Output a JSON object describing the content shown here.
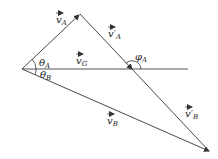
{
  "diagram": {
    "colors": {
      "line": "#333333",
      "background": "#ffffff"
    },
    "points": {
      "origin": [
        22,
        69
      ],
      "apex": [
        80,
        14
      ],
      "line_end": [
        188,
        69
      ],
      "bottom_tip": [
        210,
        152
      ]
    },
    "labels": {
      "vA": {
        "base": "v",
        "sub": "A",
        "text": "v_A"
      },
      "vpA": {
        "base": "v′",
        "sub": "A",
        "text": "v'_A"
      },
      "vG": {
        "base": "v",
        "sub": "G",
        "text": "v_G"
      },
      "vB": {
        "base": "v",
        "sub": "B",
        "text": "v_B"
      },
      "vpB": {
        "base": "v′",
        "sub": "B",
        "text": "v'_B"
      },
      "thetaA": {
        "base": "θ",
        "sub": "A",
        "text": "θ_A"
      },
      "thetaB": {
        "base": "θ",
        "sub": "B",
        "text": "θ_B"
      },
      "phiA": {
        "base": "φ",
        "sub": "A",
        "text": "φ_A"
      }
    }
  }
}
